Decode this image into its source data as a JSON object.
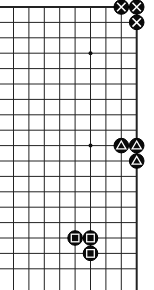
{
  "board": {
    "description": "Go board corner diagram (top-right corner)",
    "origin_x": 13.5,
    "origin_y": 7,
    "step": 15.4,
    "columns": 9,
    "rows": 18,
    "left_edge_open": true,
    "bottom_edge_open": true,
    "top_edge_thick": true,
    "right_edge_thick": true,
    "line_color": "#222222",
    "star_points": [
      {
        "col": 5,
        "row": 3
      },
      {
        "col": 5,
        "row": 9
      }
    ],
    "stones": [
      {
        "col": 7,
        "row": 0,
        "color": "black",
        "mark": "cross"
      },
      {
        "col": 8,
        "row": 0,
        "color": "black",
        "mark": "cross"
      },
      {
        "col": 8,
        "row": 1,
        "color": "black",
        "mark": "cross"
      },
      {
        "col": 7,
        "row": 9,
        "color": "black",
        "mark": "triangle"
      },
      {
        "col": 8,
        "row": 9,
        "color": "black",
        "mark": "triangle"
      },
      {
        "col": 8,
        "row": 10,
        "color": "black",
        "mark": "triangle"
      },
      {
        "col": 4,
        "row": 15,
        "color": "black",
        "mark": "square"
      },
      {
        "col": 5,
        "row": 15,
        "color": "black",
        "mark": "square"
      },
      {
        "col": 5,
        "row": 16,
        "color": "black",
        "mark": "square"
      }
    ]
  }
}
